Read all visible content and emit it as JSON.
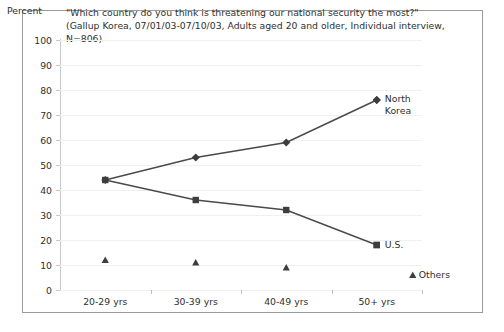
{
  "chart_data": {
    "type": "line",
    "title": "\"Which country do you think is threatening our national security the most?\" (Gallup Korea, 07/01/03-07/10/03, Adults aged 20 and older, Individual interview, N=806)",
    "xlabel": "",
    "ylabel": "Percent",
    "categories": [
      "20-29 yrs",
      "30-39 yrs",
      "40-49 yrs",
      "50+ yrs"
    ],
    "ylim": [
      0,
      100
    ],
    "ytick_step": 10,
    "yticks": [
      "100",
      "90",
      "80",
      "70",
      "60",
      "50",
      "40",
      "30",
      "20",
      "10",
      "0"
    ],
    "grid": true,
    "legend_position": "right-inline",
    "series": [
      {
        "name": "North Korea",
        "marker": "diamond",
        "values": [
          44,
          53,
          59,
          76
        ],
        "color": "#404040"
      },
      {
        "name": "U.S.",
        "marker": "square",
        "values": [
          44,
          36,
          32,
          18
        ],
        "color": "#404040"
      },
      {
        "name": "Others",
        "marker": "triangle",
        "values": [
          12,
          11,
          9,
          6
        ],
        "color": "#404040",
        "line": false
      }
    ]
  },
  "labels": {
    "north_korea": "North\nKorea",
    "us": "U.S.",
    "others": "Others"
  },
  "colors": {
    "line": "#4a4a4a",
    "marker": "#3d3d3d",
    "grid": "#f0f0f0",
    "axis": "#c8c8c8",
    "frame": "#9a9a9a",
    "text": "#2f2f2f"
  }
}
